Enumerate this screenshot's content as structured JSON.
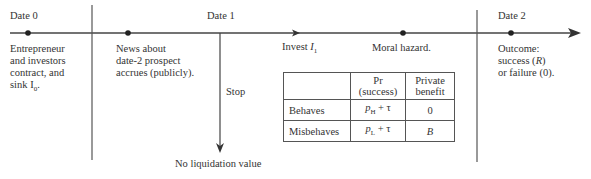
{
  "dates": [
    {
      "label": "Date 0",
      "x": 10
    },
    {
      "label": "Date 1",
      "x": 220
    },
    {
      "label": "Date 2",
      "x": 498
    }
  ],
  "events": {
    "date0": [
      "Entrepreneur",
      "and investors",
      "contract, and",
      "sink I",
      "0",
      "."
    ],
    "news": [
      "News about",
      "date-2 prospect",
      "accrues (publicly)."
    ],
    "invest": {
      "text": "Invest ",
      "var": "I",
      "sub": "1"
    },
    "moral_hazard": "Moral hazard.",
    "outcome": [
      "Outcome:",
      "success (",
      "R",
      ")",
      "or failure (0)."
    ],
    "stop": "Stop",
    "no_liquidation": "No liquidation value"
  },
  "table": {
    "headers": [
      "",
      "Pr (success)",
      "Private benefit"
    ],
    "header_lines": {
      "pr": [
        "Pr",
        "(success)"
      ],
      "benefit": [
        "Private",
        "benefit"
      ]
    },
    "rows": [
      {
        "label": "Behaves",
        "pr_var": "p",
        "pr_sub": "H",
        "pr_rest": " + τ",
        "benefit": "0"
      },
      {
        "label": "Misbehaves",
        "pr_var": "p",
        "pr_sub": "L",
        "pr_rest": " + τ",
        "benefit": "B"
      }
    ]
  },
  "colors": {
    "line": "#444444",
    "text": "#333333"
  }
}
